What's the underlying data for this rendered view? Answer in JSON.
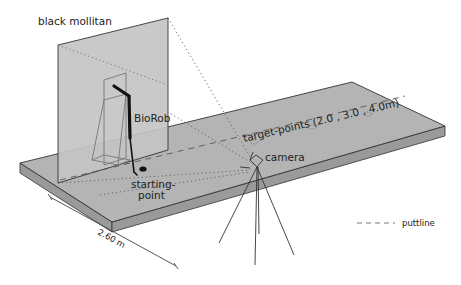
{
  "figure": {
    "labels": {
      "mollitan": "black mollitan",
      "robot": "BioRob",
      "start_line1": "starting-",
      "start_line2": "point",
      "targets": "target-points (2.0 , 3.0 , 4.0m)",
      "camera": "camera",
      "dimension": "2.60 m"
    },
    "legend": {
      "puttline": "puttline"
    },
    "colors": {
      "board_top": "#b4b4b4",
      "board_side": "#9a9a9a",
      "panel": "#c4c4c4",
      "outline": "#333333",
      "robot": "#111111"
    }
  }
}
